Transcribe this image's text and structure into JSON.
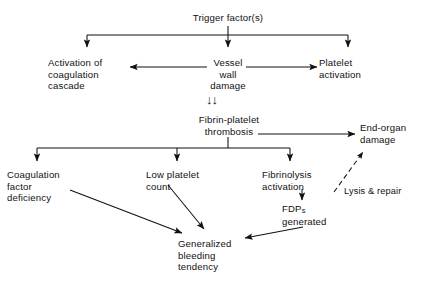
{
  "diagram": {
    "background_color": "#ffffff",
    "stroke_color": "#111111",
    "text_color": "#111111",
    "nodes": {
      "trigger": "Trigger factor(s)",
      "activation_coagulation": "Activation of\ncoagulation\ncascade",
      "vessel_wall": "Vessel\nwall\ndamage",
      "platelet_activation": "Platelet\nactivation",
      "fibrin_thrombosis": "Fibrin-platelet\nthrombosis",
      "end_organ": "End-organ\ndamage",
      "coag_factor_def": "Coagulation\nfactor\ndeficiency",
      "low_platelet": "Low platelet\ncount",
      "fibrinolysis": "Fibrinolysis\nactivation",
      "fdps_prefix": "FDP",
      "fdps_sub": "s",
      "fdps_suffix": "generated",
      "generalized_bleeding": "Generalized\nbleeding\ntendency"
    },
    "edge_labels": {
      "lysis_repair": "Lysis & repair"
    },
    "marks": {
      "double_chevron": "↓"
    }
  }
}
